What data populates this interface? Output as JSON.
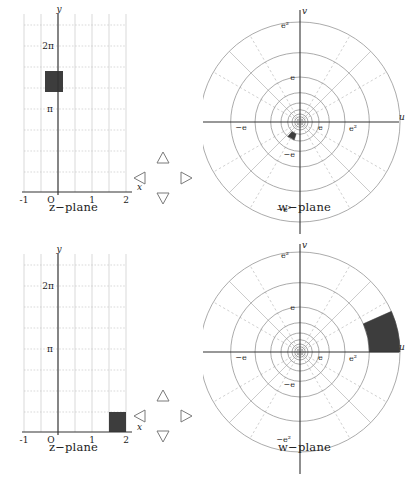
{
  "figure": {
    "panel_count": 4,
    "colors": {
      "shaded_region": "#3d3d3d",
      "axis": "#333333",
      "grid": "#c9c9c9",
      "polar_grid": "#8f8f8f",
      "polar_spoke": "#b5b5b5",
      "background": "#ffffff",
      "text": "#1c1c1c"
    }
  },
  "panels": [
    {
      "id": "top-z",
      "caption": "z−plane",
      "type": "cartesian",
      "axis_labels": {
        "x": "x",
        "y": "y"
      },
      "x_ticks": [
        "-1",
        "O",
        "1",
        "2"
      ],
      "x_tick_values": [
        -1,
        0,
        1,
        2
      ],
      "y_ticks": [
        "π",
        "2π"
      ],
      "y_tick_values": [
        3.14159,
        6.28319
      ],
      "xlim": [
        -1,
        2.2
      ],
      "ylim": [
        -0.9,
        8.2
      ],
      "grid": true,
      "shaded_region": {
        "shape": "rectangle",
        "x_range": [
          0.2,
          0.6
        ],
        "y_range": [
          4.6,
          5.4
        ]
      }
    },
    {
      "id": "top-w",
      "caption": "w−plane",
      "type": "polar",
      "axis_labels": {
        "x": "u",
        "y": "v"
      },
      "radial_ticks": [
        "e",
        "e²"
      ],
      "radial_tick_neg": [
        "−e",
        "−e²"
      ],
      "radial_values": [
        2.718,
        7.389
      ],
      "grid": true,
      "spokes": 12,
      "shaded_region": {
        "shape": "annular-sector",
        "r_range": [
          1.22,
          1.82
        ],
        "theta_range_deg": [
          228,
          252
        ]
      }
    },
    {
      "id": "bottom-z",
      "caption": "z−plane",
      "type": "cartesian",
      "axis_labels": {
        "x": "x",
        "y": "y"
      },
      "x_ticks": [
        "-1",
        "O",
        "1",
        "2"
      ],
      "x_tick_values": [
        -1,
        0,
        1,
        2
      ],
      "y_ticks": [
        "π",
        "2π"
      ],
      "y_tick_values": [
        3.14159,
        6.28319
      ],
      "xlim": [
        -1,
        2.2
      ],
      "ylim": [
        -0.9,
        8.2
      ],
      "grid": true,
      "shaded_region": {
        "shape": "rectangle",
        "x_range": [
          1.6,
          2.0
        ],
        "y_range": [
          0.0,
          0.8
        ]
      }
    },
    {
      "id": "bottom-w",
      "caption": "w−plane",
      "type": "polar",
      "axis_labels": {
        "x": "u",
        "y": "v"
      },
      "radial_ticks": [
        "e",
        "e²"
      ],
      "radial_tick_neg": [
        "−e",
        "−e²"
      ],
      "radial_values": [
        2.718,
        7.389
      ],
      "grid": true,
      "spokes": 12,
      "shaded_region": {
        "shape": "annular-sector",
        "r_range": [
          4.95,
          7.39
        ],
        "theta_range_deg": [
          0,
          24
        ]
      }
    }
  ],
  "arrow_clusters": [
    {
      "id": "top-arrows",
      "arrows": [
        "up-triangle",
        "left-triangle",
        "right-triangle",
        "down-triangle"
      ]
    },
    {
      "id": "bottom-arrows",
      "arrows": [
        "up-triangle",
        "left-triangle",
        "right-triangle",
        "down-triangle"
      ]
    }
  ]
}
